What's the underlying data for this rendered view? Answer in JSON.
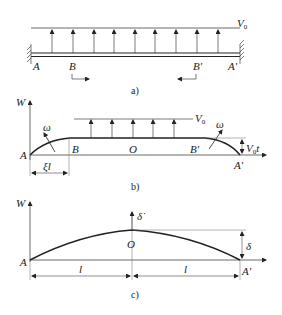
{
  "panel_a": {
    "caption": "a)",
    "velocity_label": "V",
    "velocity_sub": "0",
    "labels": {
      "A": "A",
      "B": "B",
      "B_prime": "B′",
      "A_prime": "A′"
    }
  },
  "panel_b": {
    "caption": "b)",
    "axis_label": "W",
    "velocity_label": "V",
    "velocity_sub": "0",
    "omega_left": "ω",
    "omega_right": "ω",
    "labels": {
      "A": "A",
      "B": "B",
      "O": "O",
      "B_prime": "B′",
      "A_prime": "A′"
    },
    "dim_xi_l": "ξl",
    "dim_v0t_main": "V",
    "dim_v0t_sub": "0",
    "dim_v0t_t": "t"
  },
  "panel_c": {
    "caption": "c)",
    "axis_label": "W",
    "delta_dot": "δ̇",
    "delta": "δ",
    "labels": {
      "A": "A",
      "O": "O",
      "A_prime": "A′"
    },
    "dim_left": "l",
    "dim_right": "l"
  },
  "colors": {
    "line": "#222222",
    "thin": "#444444"
  }
}
